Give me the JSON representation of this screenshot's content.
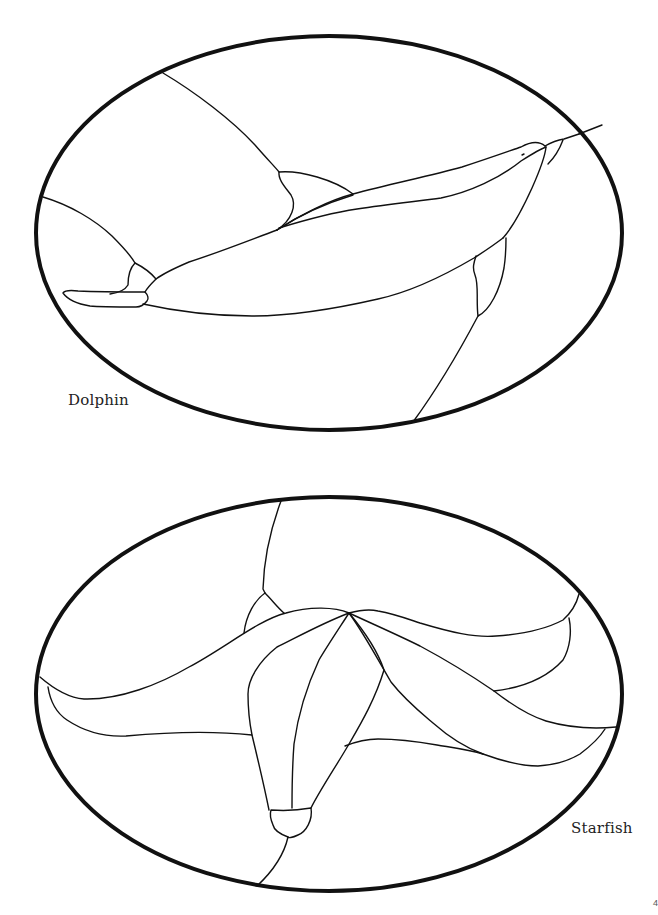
{
  "page": {
    "background": "#ffffff",
    "line_color": "#111111",
    "page_number": "4"
  },
  "panels": [
    {
      "id": "dolphin",
      "caption": "Dolphin",
      "frame": {
        "shape": "ellipse",
        "cx": 329,
        "cy": 233,
        "rx": 293,
        "ry": 197
      }
    },
    {
      "id": "starfish",
      "caption": "Starfish",
      "frame": {
        "shape": "ellipse",
        "cx": 329,
        "cy": 694,
        "rx": 293,
        "ry": 197
      }
    }
  ]
}
